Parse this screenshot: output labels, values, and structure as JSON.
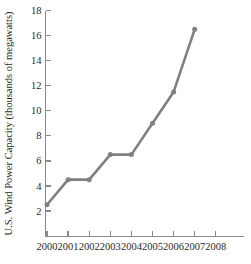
{
  "chart_data": {
    "type": "line",
    "title": "",
    "subtitle": "",
    "xlabel": "",
    "ylabel": "U.S. Wind Power Capacity (thousands of megawatts)",
    "x": [
      2000,
      2001,
      2002,
      2003,
      2004,
      2005,
      2006,
      2007
    ],
    "values": [
      2.5,
      4.5,
      4.5,
      6.5,
      6.5,
      9.0,
      11.5,
      16.5
    ],
    "series": [
      {
        "name": "U.S. Wind Power Capacity",
        "values": [
          2.5,
          4.5,
          4.5,
          6.5,
          6.5,
          9.0,
          11.5,
          16.5
        ]
      }
    ],
    "x_tick_labels": [
      "2000",
      "2001",
      "2002",
      "2003",
      "2004",
      "2005",
      "2006",
      "2007",
      "2008"
    ],
    "x_tick_values": [
      2000,
      2001,
      2002,
      2003,
      2004,
      2005,
      2006,
      2007,
      2008
    ],
    "y_tick_labels": [
      "2",
      "4",
      "6",
      "8",
      "10",
      "12",
      "14",
      "16",
      "18"
    ],
    "y_tick_values": [
      2,
      4,
      6,
      8,
      10,
      12,
      14,
      16,
      18
    ],
    "xlim": [
      1999.5,
      2008.5
    ],
    "ylim": [
      0,
      18
    ],
    "grid": false,
    "legend": false,
    "legend_position": "none",
    "line_color": "#808080",
    "marker_color": "#808080",
    "axis_color": "#8a8a8a",
    "text_color": "#1f1f1f",
    "background_color": "#ffffff",
    "marker": "circle",
    "annotations": []
  }
}
